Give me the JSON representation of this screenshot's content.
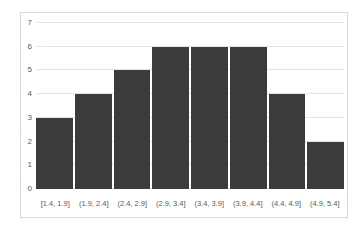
{
  "chart_data": {
    "type": "bar",
    "subtype": "histogram",
    "title": "",
    "xlabel": "",
    "ylabel": "",
    "categories": [
      "[1.4, 1.9]",
      "(1.9, 2.4]",
      "(2.4, 2.9]",
      "(2.9, 3.4]",
      "(3.4, 3.9]",
      "(3.9, 4.4]",
      "(4.4, 4.9]",
      "(4.9, 5.4]"
    ],
    "values": [
      3,
      4,
      5,
      6,
      6,
      6,
      4,
      2
    ],
    "ylim": [
      0,
      7
    ],
    "yticks": [
      0,
      1,
      2,
      3,
      4,
      5,
      6,
      7
    ],
    "grid": true,
    "legend": false,
    "colors": {
      "bar": "#3b3b3b",
      "gridline": "#e4e4e4",
      "frame_border": "#d9d9d9",
      "tick_text": "#595959",
      "background": "#ffffff"
    }
  }
}
